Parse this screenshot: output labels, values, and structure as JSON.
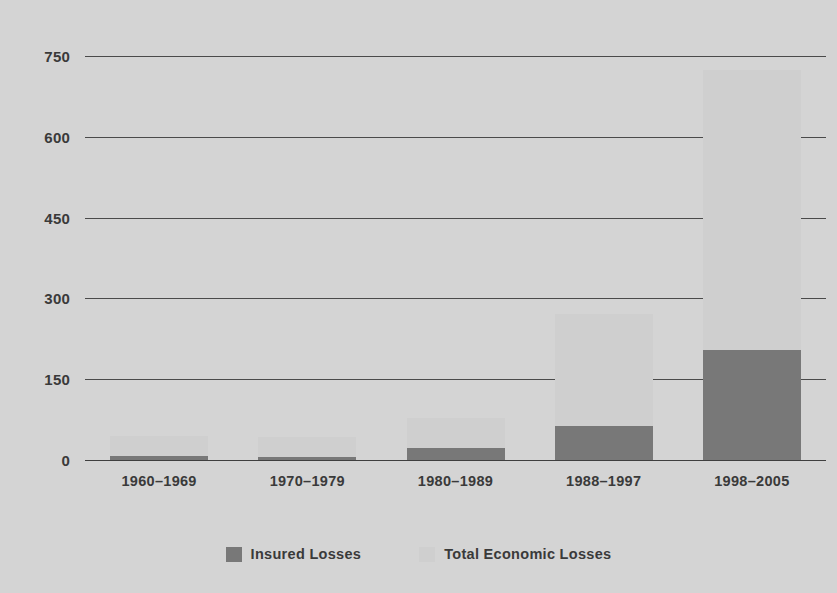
{
  "chart_data": {
    "type": "bar",
    "subtype": "stacked-overlay",
    "title": "",
    "xlabel": "",
    "ylabel": "",
    "categories": [
      "1960–1969",
      "1970–1979",
      "1980–1989",
      "1988–1997",
      "1998–2005"
    ],
    "series": [
      {
        "name": "Insured Losses",
        "color": "#787878",
        "values": [
          8,
          5,
          23,
          64,
          204
        ]
      },
      {
        "name": "Total Economic Losses",
        "color": "#cfcfcf",
        "values": [
          45,
          42,
          78,
          271,
          724
        ]
      }
    ],
    "ylim": [
      0,
      780
    ],
    "yticks": [
      0,
      150,
      300,
      450,
      600,
      750
    ],
    "ytick_labels": [
      "0",
      "150",
      "300",
      "450",
      "600",
      "750"
    ],
    "grid": true,
    "grid_axis": "y",
    "legend_position": "bottom-center"
  },
  "style": {
    "background": "#d4d4d4",
    "text_color": "#3a3a3a",
    "gridline_color": "#4a4a4a",
    "insured_color": "#787878",
    "total_color": "#cfcfcf"
  }
}
